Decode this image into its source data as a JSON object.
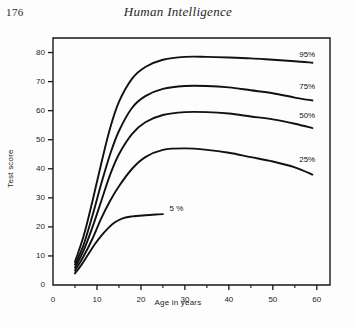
{
  "page": {
    "folio": "176",
    "running_head": "Human Intelligence"
  },
  "chart_data": {
    "type": "line",
    "title": "",
    "xlabel": "Age in years",
    "ylabel": "Test score",
    "xlim": [
      0,
      63
    ],
    "ylim": [
      0,
      85
    ],
    "grid": false,
    "legend_position": "inline-right-of-curve",
    "xticks": [
      0,
      10,
      20,
      30,
      40,
      50,
      60
    ],
    "xticklabels": [
      "0",
      "10",
      "20",
      "30",
      "40",
      "50",
      "60"
    ],
    "xminorticks": [
      5,
      15,
      25,
      35,
      45,
      55
    ],
    "yticks": [
      0,
      10,
      20,
      30,
      40,
      50,
      60,
      70,
      80
    ],
    "yticklabels": [
      "0",
      "10",
      "20",
      "30",
      "40",
      "50",
      "60",
      "70",
      "80"
    ],
    "series": [
      {
        "name": "95%",
        "label": "95%",
        "label_x": 56,
        "label_y": 79,
        "x": [
          5,
          7,
          9,
          11,
          13,
          15,
          18,
          21,
          25,
          30,
          35,
          40,
          45,
          50,
          55,
          59
        ],
        "y": [
          8,
          17,
          29,
          42,
          54,
          63,
          71,
          75,
          77.5,
          78.5,
          78.5,
          78.3,
          78,
          77.5,
          77,
          76.5
        ]
      },
      {
        "name": "75%",
        "label": "75%",
        "label_x": 56,
        "label_y": 68,
        "x": [
          5,
          7,
          9,
          11,
          13,
          15,
          18,
          21,
          25,
          30,
          35,
          40,
          45,
          50,
          55,
          59
        ],
        "y": [
          7,
          14,
          24,
          35,
          45,
          53,
          61,
          65,
          67.5,
          68.5,
          68.5,
          68,
          67,
          66,
          64.5,
          63.5
        ]
      },
      {
        "name": "50%",
        "label": "50%",
        "label_x": 56,
        "label_y": 58,
        "x": [
          5,
          7,
          9,
          11,
          13,
          15,
          18,
          21,
          25,
          30,
          35,
          40,
          45,
          50,
          55,
          59
        ],
        "y": [
          6,
          12,
          20,
          29,
          38,
          45,
          52,
          56,
          58.5,
          59.5,
          59.5,
          59,
          58,
          57,
          55.5,
          54
        ]
      },
      {
        "name": "25%",
        "label": "25%",
        "label_x": 56,
        "label_y": 43,
        "x": [
          5,
          7,
          9,
          11,
          13,
          15,
          18,
          21,
          25,
          30,
          35,
          40,
          45,
          50,
          55,
          59
        ],
        "y": [
          5,
          10,
          16,
          23,
          29,
          34,
          40,
          44,
          46.5,
          47,
          46.5,
          45.5,
          44,
          42.5,
          40.5,
          38
        ]
      },
      {
        "name": "5%",
        "label": "5 %",
        "label_x": 26.5,
        "label_y": 26,
        "x": [
          5,
          6.5,
          8,
          9.5,
          11,
          12.5,
          14,
          16,
          18,
          21,
          24,
          25
        ],
        "y": [
          4,
          7,
          10.5,
          14,
          17,
          19.5,
          21.5,
          23,
          23.6,
          24,
          24.3,
          24.4
        ]
      }
    ]
  }
}
